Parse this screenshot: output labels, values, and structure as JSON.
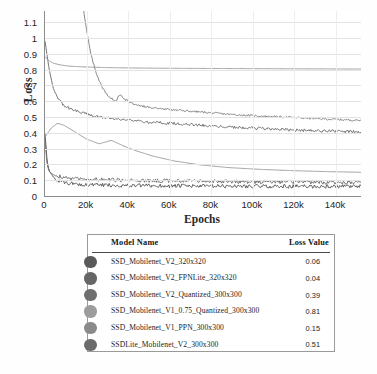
{
  "chart_data": {
    "type": "line",
    "title": "",
    "xlabel": "Epochs",
    "ylabel": "Loss",
    "xlim": [
      0,
      152000
    ],
    "ylim": [
      0,
      1.17
    ],
    "grid": true,
    "legend_position": "below-table",
    "xticks": [
      "0",
      "20k",
      "40k",
      "60k",
      "80k",
      "100k",
      "120k",
      "140k"
    ],
    "xtick_values": [
      0,
      20000,
      40000,
      60000,
      80000,
      100000,
      120000,
      140000
    ],
    "yticks": [
      "0",
      "0.1",
      "0.2",
      "0.3",
      "0.4",
      "0.5",
      "0.6",
      "0.7",
      "0.8",
      "0.9",
      "1",
      "1.1"
    ],
    "ytick_values": [
      0,
      0.1,
      0.2,
      0.3,
      0.4,
      0.5,
      0.6,
      0.7,
      0.8,
      0.9,
      1.0,
      1.1
    ],
    "series": [
      {
        "name": "SSD_Mobilenet_V2_320x320",
        "final_loss": 0.06,
        "color": "#5a5a5a",
        "x": [
          0,
          1000,
          2000,
          4000,
          6000,
          9000,
          13000,
          18000,
          24000,
          32000,
          40000,
          50000,
          60000,
          72000,
          84000,
          96000,
          108000,
          120000,
          132000,
          144000,
          152000
        ],
        "values": [
          0.4,
          0.22,
          0.16,
          0.12,
          0.1,
          0.085,
          0.078,
          0.072,
          0.07,
          0.068,
          0.066,
          0.065,
          0.064,
          0.063,
          0.062,
          0.062,
          0.061,
          0.061,
          0.06,
          0.06,
          0.06
        ]
      },
      {
        "name": "SSD_Mobilenet_V2_FPNLite_320x320",
        "final_loss": 0.04,
        "color": "#6e6e6e",
        "x": [
          0,
          1000,
          2000,
          4000,
          6000,
          9000,
          13000,
          18000,
          24000,
          32000,
          40000,
          50000,
          60000,
          72000,
          84000,
          96000,
          108000,
          120000,
          132000,
          144000,
          152000
        ],
        "values": [
          0.36,
          0.2,
          0.155,
          0.135,
          0.125,
          0.118,
          0.112,
          0.108,
          0.105,
          0.102,
          0.1,
          0.098,
          0.096,
          0.094,
          0.092,
          0.09,
          0.089,
          0.088,
          0.086,
          0.085,
          0.085
        ]
      },
      {
        "name": "SSD_Mobilenet_V2_Quantized_300x300",
        "final_loss": 0.39,
        "color": "#707070",
        "x": [
          0,
          2000,
          4000,
          6000,
          9000,
          13000,
          18000,
          24000,
          32000,
          40000,
          50000,
          60000,
          72000,
          84000,
          96000,
          108000,
          120000,
          132000,
          144000,
          152000
        ],
        "values": [
          0.98,
          0.8,
          0.68,
          0.62,
          0.575,
          0.545,
          0.525,
          0.505,
          0.49,
          0.478,
          0.468,
          0.46,
          0.45,
          0.44,
          0.432,
          0.425,
          0.418,
          0.412,
          0.408,
          0.405
        ]
      },
      {
        "name": "SSD_Mobilenet_V1_0.75_Quantized_300x300",
        "final_loss": 0.81,
        "color": "#9b9b9b",
        "x": [
          0,
          2000,
          4000,
          7000,
          11000,
          16000,
          22000,
          30000,
          40000,
          55000,
          70000,
          90000,
          110000,
          130000,
          152000
        ],
        "values": [
          0.88,
          0.855,
          0.84,
          0.83,
          0.822,
          0.818,
          0.815,
          0.812,
          0.81,
          0.808,
          0.807,
          0.806,
          0.805,
          0.804,
          0.803
        ]
      },
      {
        "name": "SSD_Mobilenet_V1_PPN_300x300",
        "final_loss": 0.15,
        "color": "#9a9a9a",
        "x": [
          0,
          3000,
          6000,
          9000,
          12000,
          16000,
          20000,
          26000,
          32000,
          38000,
          44000,
          52000,
          62000,
          74000,
          88000,
          104000,
          120000,
          136000,
          152000
        ],
        "values": [
          0.375,
          0.43,
          0.46,
          0.448,
          0.425,
          0.392,
          0.36,
          0.33,
          0.352,
          0.315,
          0.285,
          0.252,
          0.222,
          0.198,
          0.18,
          0.168,
          0.16,
          0.154,
          0.15
        ]
      },
      {
        "name": "SSDLite_Mobilenet_V2_300x300",
        "final_loss": 0.51,
        "color": "#838383",
        "x": [
          18000,
          20000,
          22000,
          25000,
          28000,
          31000,
          34000,
          36000,
          38000,
          42000,
          48000,
          56000,
          66000,
          78000,
          90000,
          104000,
          118000,
          134000,
          152000
        ],
        "values": [
          1.22,
          1.05,
          0.9,
          0.76,
          0.675,
          0.625,
          0.6,
          0.64,
          0.615,
          0.585,
          0.565,
          0.552,
          0.54,
          0.528,
          0.515,
          0.505,
          0.498,
          0.487,
          0.478
        ]
      }
    ]
  },
  "legend": {
    "headers": {
      "model_name": "Model Name",
      "loss_value": "Loss Value"
    },
    "rows": [
      {
        "swatch": "#595959",
        "name": "SSD_Mobilenet_V2_320x320",
        "value": "0.06"
      },
      {
        "swatch": "#666666",
        "name": "SSD_Mobilenet_V2_FPNLite_320x320",
        "value": "0.04"
      },
      {
        "swatch": "#6f6f6f",
        "name": "SSD_Mobilenet_V2_Quantized_300x300",
        "value": "0.39"
      },
      {
        "swatch": "#9c9c9c",
        "name": "SSD_Mobilenet_V1_0.75_Quantized_300x300",
        "value": "0.81"
      },
      {
        "swatch": "#8a8a8a",
        "name": "SSD_Mobilenet_V1_PPN_300x300",
        "value": "0.15"
      },
      {
        "swatch": "#6b6b6b",
        "name": "SSDLite_Mobilenet_V2_300x300",
        "value": "0.51"
      }
    ]
  },
  "caption": {
    "text": ""
  }
}
